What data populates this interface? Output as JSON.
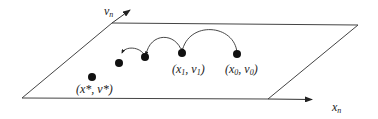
{
  "diagram": {
    "axes": {
      "vertical": {
        "label": "v",
        "subscript": "n"
      },
      "horizontal": {
        "label": "x",
        "subscript": "n"
      }
    },
    "points": [
      {
        "id": "x0v0",
        "label": "(x",
        "sub": "0",
        "mid": ", v",
        "sub2": "0",
        "end": ")"
      },
      {
        "id": "x1v1",
        "label": "(x",
        "sub": "1",
        "mid": ", v",
        "sub2": "1",
        "end": ")"
      },
      {
        "id": "xstar",
        "label": "(x*, v*)"
      }
    ],
    "colors": {
      "line": "#333333",
      "dot": "#111111"
    }
  }
}
